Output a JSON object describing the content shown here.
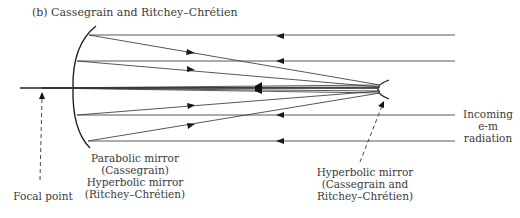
{
  "title": "(b) Cassegrain and Ritchey–Chrétien",
  "labels": {
    "primary_line1": "Parabolic mirror",
    "primary_line2": "(Cassegrain)",
    "primary_line3": "Hyperbolic mirror",
    "primary_line4": "(Ritchey–Chrétien)",
    "focal_point": "Focal point",
    "secondary_line1": "Hyperbolic mirror",
    "secondary_line2": "(Cassegrain and",
    "secondary_line3": "Ritchey–Chrétien)",
    "incoming_line1": "Incoming",
    "incoming_line2": "e-m",
    "incoming_line3": "radiation"
  },
  "colors": {
    "line": "#2a2a2a",
    "text": "#3a3a3a"
  }
}
